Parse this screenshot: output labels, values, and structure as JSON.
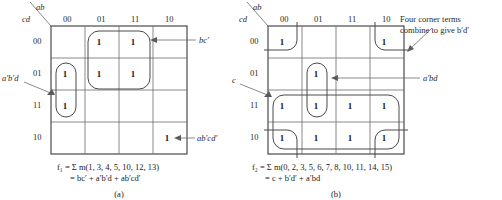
{
  "figure": {
    "caption_a": "(a)",
    "caption_b": "(b)"
  },
  "maps": [
    {
      "id": "map-a",
      "var_top_label": "ab",
      "var_left_label": "cd",
      "col_headers": [
        "00",
        "01",
        "11",
        "10"
      ],
      "row_headers": [
        "00",
        "01",
        "11",
        "10"
      ],
      "cells": [
        [
          "",
          "1",
          "1",
          ""
        ],
        [
          "1",
          "1",
          "1",
          ""
        ],
        [
          "1",
          "",
          "",
          ""
        ],
        [
          "",
          "",
          "",
          "1"
        ]
      ],
      "annotations": [
        {
          "name": "bc-prime",
          "text": "bc′"
        },
        {
          "name": "a-prime-b-prime-d",
          "text": "a′b′d"
        },
        {
          "name": "ab-prime-cd-prime",
          "text": "ab′cd′"
        }
      ],
      "equation_line1": "f₁ = Σ m(1, 3, 4, 5, 10, 12, 13)",
      "equation_line2": "= bc′ + a′b′d + ab′cd′",
      "minterms": [
        1,
        3,
        4,
        5,
        10,
        12,
        13
      ],
      "function_name": "f1",
      "sop_terms": [
        "bc′",
        "a′b′d",
        "ab′cd′"
      ]
    },
    {
      "id": "map-b",
      "var_top_label": "ab",
      "var_left_label": "cd",
      "col_headers": [
        "00",
        "01",
        "11",
        "10"
      ],
      "row_headers": [
        "00",
        "01",
        "11",
        "10"
      ],
      "cells": [
        [
          "1",
          "",
          "",
          "1"
        ],
        [
          "",
          "1",
          "",
          ""
        ],
        [
          "1",
          "1",
          "1",
          "1"
        ],
        [
          "1",
          "1",
          "1",
          "1"
        ]
      ],
      "annotations": [
        {
          "name": "four-corner-note-line1",
          "text": "Four corner terms"
        },
        {
          "name": "four-corner-note-line2",
          "text": "combine to give b′d′"
        },
        {
          "name": "a-prime-bd",
          "text": "a′bd"
        },
        {
          "name": "c-term",
          "text": "c"
        }
      ],
      "equation_line1": "f₂ = Σ m(0, 2, 3, 5, 6, 7, 8, 10, 11, 14, 15)",
      "equation_line2": "= c + b′d′ + a′bd",
      "minterms": [
        0,
        2,
        3,
        5,
        6,
        7,
        8,
        10,
        11,
        14,
        15
      ],
      "function_name": "f2",
      "sop_terms": [
        "c",
        "b′d′",
        "a′bd"
      ]
    }
  ],
  "colors": {
    "grid_line": "#6e6a68",
    "grid_border": "#3a3a3a",
    "group_outline": "#4a4a4a",
    "leader": "#6e6a68",
    "text": "#231f20",
    "background": "#ffffff"
  }
}
